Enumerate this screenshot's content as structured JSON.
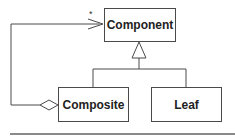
{
  "diagram": {
    "type": "UML class diagram",
    "pattern": "Composite",
    "classes": [
      {
        "id": "component",
        "name": "Component"
      },
      {
        "id": "composite",
        "name": "Composite"
      },
      {
        "id": "leaf",
        "name": "Leaf"
      }
    ],
    "relationships": [
      {
        "type": "generalization",
        "from": "Composite",
        "to": "Component"
      },
      {
        "type": "generalization",
        "from": "Leaf",
        "to": "Component"
      },
      {
        "type": "aggregation",
        "from": "Composite",
        "to": "Component",
        "multiplicity": "*"
      }
    ],
    "multiplicity_label": "*",
    "colors": {
      "line": "#4a4a4a",
      "text": "#222222",
      "rule": "#8a8a8a"
    }
  }
}
